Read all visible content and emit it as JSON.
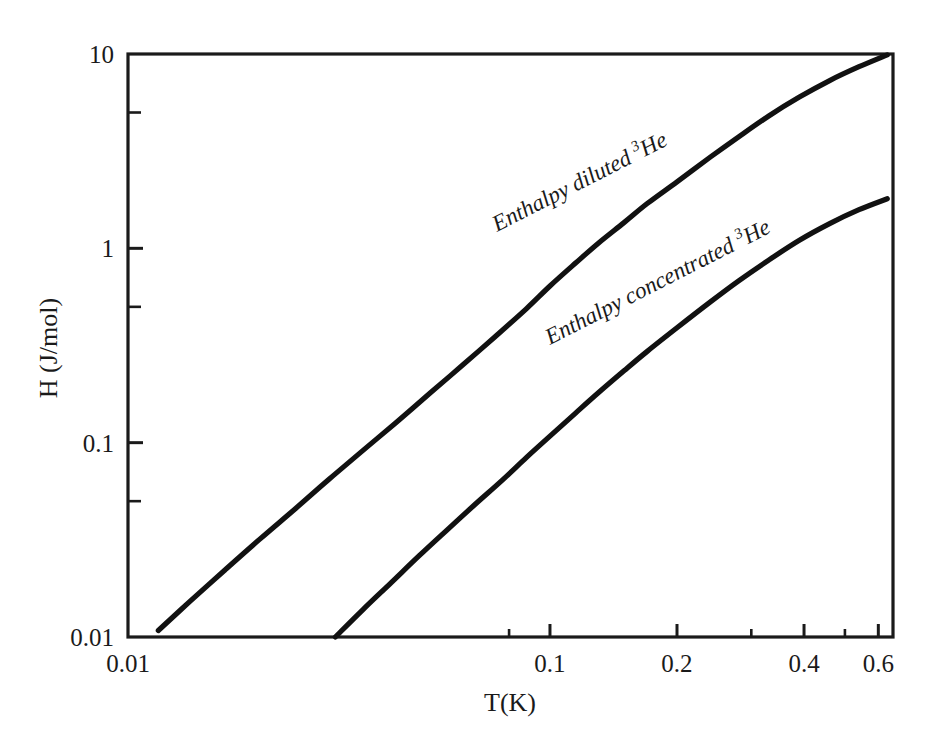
{
  "chart_data": {
    "type": "line",
    "title": "",
    "xlabel": "T(K)",
    "ylabel": "H (J/mol)",
    "xscale": "log",
    "yscale": "log",
    "xlim": [
      0.01,
      0.65
    ],
    "ylim": [
      0.01,
      10
    ],
    "grid": false,
    "legend_position": "inline-curve-labels",
    "x_major_ticks": [
      {
        "value": 0.01,
        "label": "0.01"
      },
      {
        "value": 0.1,
        "label": "0.1"
      },
      {
        "value": 0.2,
        "label": "0.2"
      },
      {
        "value": 0.4,
        "label": "0.4"
      },
      {
        "value": 0.6,
        "label": "0.6"
      }
    ],
    "x_minor_ticks": [
      {
        "value": 0.08,
        "label": ""
      },
      {
        "value": 0.3,
        "label": ""
      },
      {
        "value": 0.5,
        "label": ""
      }
    ],
    "y_major_ticks": [
      {
        "value": 10,
        "label": "10"
      },
      {
        "value": 1,
        "label": "1"
      },
      {
        "value": 0.1,
        "label": "0.1"
      },
      {
        "value": 0.01,
        "label": "0.01"
      }
    ],
    "y_minor_ticks": [
      {
        "value": 5,
        "label": ""
      },
      {
        "value": 0.5,
        "label": ""
      },
      {
        "value": 0.05,
        "label": ""
      }
    ],
    "series": [
      {
        "name": "Enthalpy diluted 3He",
        "label_text": "Enthalpy diluted",
        "label_superscript": "3",
        "label_suffix": "He",
        "label_rotation_deg": -27,
        "color": "#111111",
        "points": [
          [
            0.0118,
            0.0108
          ],
          [
            0.014,
            0.0152
          ],
          [
            0.017,
            0.0222
          ],
          [
            0.0205,
            0.0318
          ],
          [
            0.025,
            0.046
          ],
          [
            0.03,
            0.065
          ],
          [
            0.036,
            0.091
          ],
          [
            0.043,
            0.126
          ],
          [
            0.052,
            0.18
          ],
          [
            0.062,
            0.25
          ],
          [
            0.074,
            0.35
          ],
          [
            0.088,
            0.49
          ],
          [
            0.1,
            0.64
          ],
          [
            0.115,
            0.84
          ],
          [
            0.13,
            1.06
          ],
          [
            0.15,
            1.36
          ],
          [
            0.17,
            1.7
          ],
          [
            0.2,
            2.2
          ],
          [
            0.24,
            2.95
          ],
          [
            0.28,
            3.75
          ],
          [
            0.33,
            4.8
          ],
          [
            0.39,
            6.0
          ],
          [
            0.46,
            7.3
          ],
          [
            0.54,
            8.6
          ],
          [
            0.63,
            9.9
          ]
        ]
      },
      {
        "name": "Enthalpy concentrated 3He",
        "label_text": "Enthalpy concentrated",
        "label_superscript": "3",
        "label_suffix": "He",
        "label_rotation_deg": -27,
        "color": "#111111",
        "points": [
          [
            0.031,
            0.01
          ],
          [
            0.036,
            0.0138
          ],
          [
            0.042,
            0.019
          ],
          [
            0.049,
            0.0262
          ],
          [
            0.057,
            0.0355
          ],
          [
            0.066,
            0.0475
          ],
          [
            0.077,
            0.064
          ],
          [
            0.088,
            0.084
          ],
          [
            0.1,
            0.108
          ],
          [
            0.115,
            0.142
          ],
          [
            0.13,
            0.18
          ],
          [
            0.15,
            0.235
          ],
          [
            0.17,
            0.295
          ],
          [
            0.2,
            0.39
          ],
          [
            0.24,
            0.53
          ],
          [
            0.28,
            0.68
          ],
          [
            0.33,
            0.87
          ],
          [
            0.39,
            1.1
          ],
          [
            0.46,
            1.34
          ],
          [
            0.54,
            1.58
          ],
          [
            0.63,
            1.8
          ]
        ]
      }
    ]
  },
  "axes": {
    "x_title": "T(K)",
    "y_title": "H (J/mol)"
  },
  "labels": {
    "x_tick_0": "0.01",
    "x_tick_1": "0.1",
    "x_tick_2": "0.2",
    "x_tick_3": "0.4",
    "x_tick_4": "0.6",
    "y_tick_0": "10",
    "y_tick_1": "1",
    "y_tick_2": "0.1",
    "y_tick_3": "0.01",
    "curve_diluted_main": "Enthalpy diluted",
    "curve_diluted_sup": "3",
    "curve_diluted_tail": "He",
    "curve_concentrated_main": "Enthalpy concentrated",
    "curve_concentrated_sup": "3",
    "curve_concentrated_tail": "He"
  },
  "colors": {
    "curve": "#111111",
    "axis": "#1a1a1a",
    "background": "#ffffff"
  }
}
